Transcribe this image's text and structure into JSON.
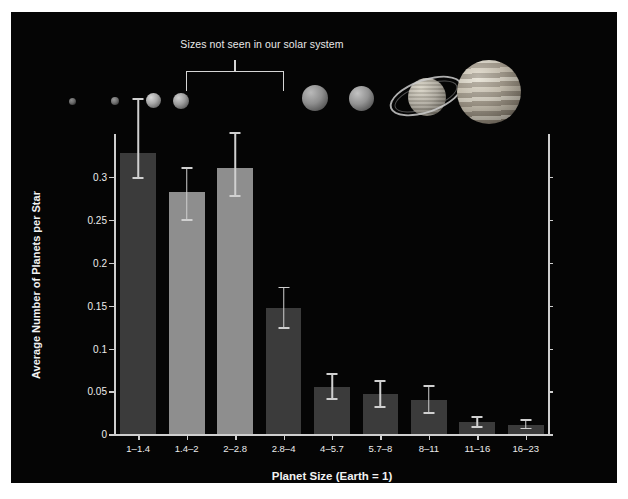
{
  "chart_data": {
    "type": "bar",
    "title": "",
    "xlabel": "Planet Size (Earth = 1)",
    "ylabel": "Average Number of Planets per Star",
    "categories": [
      "1–1.4",
      "1.4–2",
      "2–2.8",
      "2.8–4",
      "4–5.7",
      "5.7–8",
      "8–11",
      "11–16",
      "16–23"
    ],
    "values": [
      0.328,
      0.282,
      0.31,
      0.147,
      0.055,
      0.047,
      0.04,
      0.014,
      0.011
    ],
    "err_low": [
      0.298,
      0.249,
      0.277,
      0.123,
      0.04,
      0.031,
      0.024,
      0.008,
      0.006
    ],
    "err_high": [
      0.392,
      0.311,
      0.352,
      0.172,
      0.071,
      0.063,
      0.057,
      0.021,
      0.018
    ],
    "bar_colors": [
      "#3b3b3b",
      "#8e8e8e",
      "#8e8e8e",
      "#3b3b3b",
      "#3b3b3b",
      "#3b3b3b",
      "#3b3b3b",
      "#3b3b3b",
      "#3b3b3b"
    ],
    "ylim": [
      0,
      0.35
    ],
    "yticks": [
      0,
      0.05,
      0.1,
      0.15,
      0.2,
      0.25,
      0.3
    ],
    "ytick_labels": [
      "0",
      "0.05",
      "0.1",
      "0.15",
      "0.2",
      "0.25",
      "0.3"
    ],
    "grid": false,
    "legend": "none",
    "background_color": "#050505",
    "text_color": "#ececec",
    "errorbar_color": "#d0d0d0"
  },
  "annotation": {
    "text": "Sizes not seen in our solar system",
    "bracket_from_category": "1.4–2",
    "bracket_to_category": "2.8–4"
  },
  "planets": [
    {
      "name": "mercury",
      "label": "Mercury"
    },
    {
      "name": "mars",
      "label": "Mars"
    },
    {
      "name": "venus",
      "label": "Venus"
    },
    {
      "name": "earth",
      "label": "Earth"
    },
    {
      "name": "uranus",
      "label": "Uranus"
    },
    {
      "name": "neptune",
      "label": "Neptune"
    },
    {
      "name": "saturn",
      "label": "Saturn"
    },
    {
      "name": "jupiter",
      "label": "Jupiter"
    }
  ]
}
